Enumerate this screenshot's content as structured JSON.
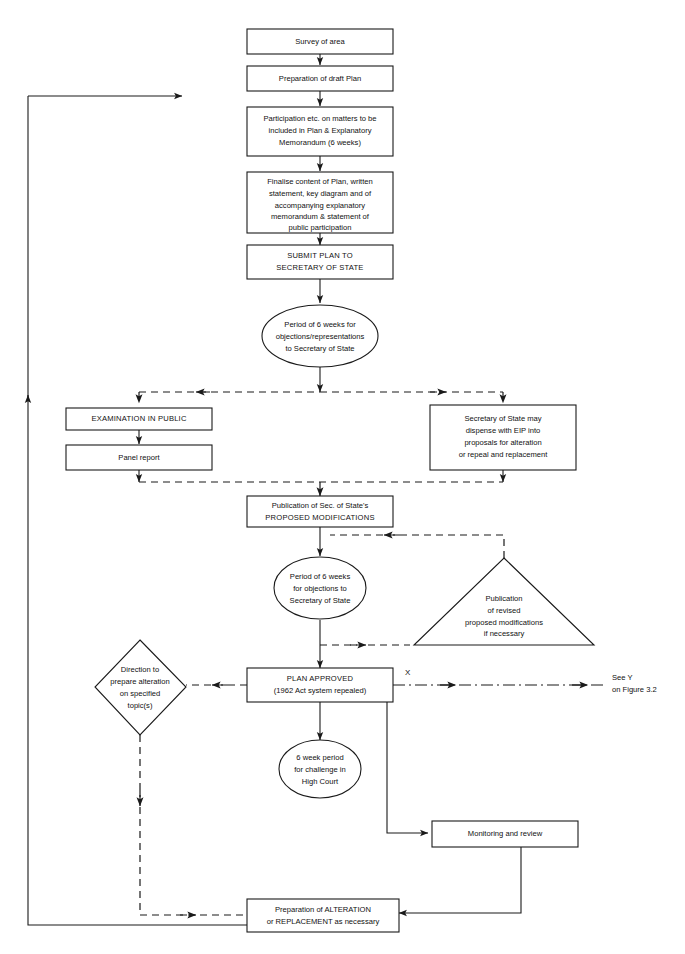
{
  "figure": {
    "domain": "diagram",
    "background": "#ffffff",
    "stroke": "#1a1a1a",
    "width": 685,
    "height": 954
  },
  "nodes": {
    "survey": {
      "shape": "rect",
      "lines": [
        "Survey of area"
      ]
    },
    "draft_plan": {
      "shape": "rect",
      "lines": [
        "Preparation of draft Plan"
      ]
    },
    "participation": {
      "shape": "rect",
      "lines": [
        "Participation etc. on matters to be",
        "included in Plan & Explanatory",
        "Memorandum (6 weeks)"
      ]
    },
    "finalise": {
      "shape": "rect",
      "lines": [
        "Finalise content of Plan, written",
        "statement, key diagram and of",
        "accompanying explanatory",
        "memorandum & statement of",
        "public participation"
      ]
    },
    "submit": {
      "shape": "rect",
      "lines": [
        "SUBMIT PLAN TO",
        "SECRETARY OF STATE"
      ]
    },
    "period6weeks_objections": {
      "shape": "ellipse",
      "lines": [
        "Period of 6 weeks for",
        "objections/representations",
        "to Secretary of State"
      ]
    },
    "examination": {
      "shape": "rect",
      "lines": [
        "EXAMINATION IN PUBLIC"
      ]
    },
    "panel_report": {
      "shape": "rect",
      "lines": [
        "Panel report"
      ]
    },
    "dispense_eip": {
      "shape": "rect",
      "lines": [
        "Secretary of State may",
        "dispense with EIP into",
        "proposals for alteration",
        "or repeal and replacement"
      ]
    },
    "proposed_mods": {
      "shape": "rect",
      "lines": [
        "Publication of Sec. of State's",
        "PROPOSED MODIFICATIONS"
      ]
    },
    "period6weeks_mods": {
      "shape": "ellipse",
      "lines": [
        "Period of 6 weeks",
        "for objections to",
        "Secretary of State"
      ]
    },
    "revised_mods": {
      "shape": "triangle",
      "lines": [
        "Publication",
        "of revised",
        "proposed modifications",
        "if necessary"
      ]
    },
    "direction": {
      "shape": "diamond",
      "lines": [
        "Direction to",
        "prepare alteration",
        "on specified",
        "topic(s)"
      ]
    },
    "plan_approved": {
      "shape": "rect",
      "lines": [
        "PLAN APPROVED",
        "(1962 Act system repealed)"
      ]
    },
    "high_court": {
      "shape": "ellipse",
      "lines": [
        "6 week period",
        "for challenge in",
        "High Court"
      ]
    },
    "monitoring": {
      "shape": "rect",
      "lines": [
        "Monitoring and review"
      ]
    },
    "alteration": {
      "shape": "rect",
      "lines": [
        "Preparation of ALTERATION",
        "or REPLACEMENT as necessary"
      ]
    }
  },
  "annotations": {
    "cross_ref_marker": "X",
    "cross_ref_note": [
      "See Y",
      "on Figure 3.2"
    ]
  }
}
